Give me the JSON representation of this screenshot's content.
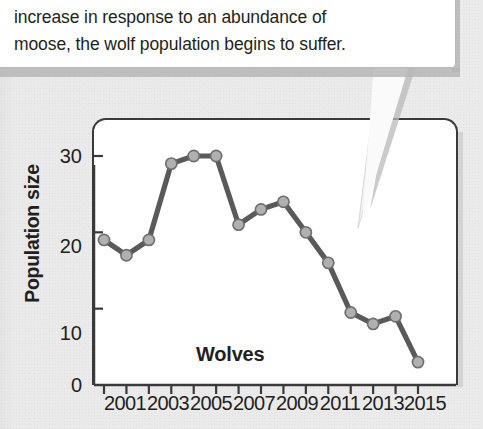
{
  "callout": {
    "text": "increase in response to an abundance of\nmoose, the wolf population begins to suffer."
  },
  "axis": {
    "y_title": "Population size",
    "y_ticks": [
      "0",
      "10",
      "20",
      "30"
    ],
    "x_tick_labels": [
      "2001",
      "2003",
      "2005",
      "2007",
      "2009",
      "2011",
      "2013",
      "2015"
    ]
  },
  "series_label": "Wolves",
  "colors": {
    "line": "#5a5a5a",
    "marker_fill": "#b0b0b0",
    "marker_stroke": "#6e6e6e",
    "axis": "#3a3a3a",
    "page_background": "#ebebeb",
    "plot_background": "#ffffff",
    "text": "#231f20"
  },
  "chart_data": {
    "type": "line",
    "title": "",
    "xlabel": "",
    "ylabel": "Population size",
    "xlim": [
      2000,
      2016
    ],
    "ylim": [
      0,
      34
    ],
    "grid": false,
    "legend": "none",
    "annotations": [
      "Wolves"
    ],
    "x": [
      2001,
      2002,
      2003,
      2004,
      2005,
      2006,
      2007,
      2008,
      2009,
      2010,
      2011,
      2012,
      2013,
      2014,
      2015
    ],
    "series": [
      {
        "name": "Wolves",
        "values": [
          19,
          17,
          19,
          29,
          30,
          30,
          21,
          23,
          24,
          20,
          16,
          9.5,
          8,
          9,
          3
        ]
      }
    ]
  }
}
